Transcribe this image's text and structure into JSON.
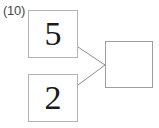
{
  "figure": {
    "problem_number": "(10)",
    "background_color": "#ffffff",
    "box_border_color": "#b3b3b3",
    "result_border_color": "#9e9e9e",
    "line_color": "#8c8c8c",
    "digit_color": "#1a1a1a",
    "label_color": "#4a4a4a"
  },
  "operands": [
    {
      "name": "top-operand",
      "value": "5"
    },
    {
      "name": "bottom-operand",
      "value": "2"
    }
  ],
  "result": {
    "value": "",
    "empty": true
  },
  "connectors": [
    {
      "name": "top-operand-to-result",
      "from": [
        78,
        47
      ],
      "to": [
        105,
        65
      ]
    },
    {
      "name": "bottom-operand-to-result",
      "from": [
        78,
        85
      ],
      "to": [
        105,
        65
      ]
    }
  ]
}
